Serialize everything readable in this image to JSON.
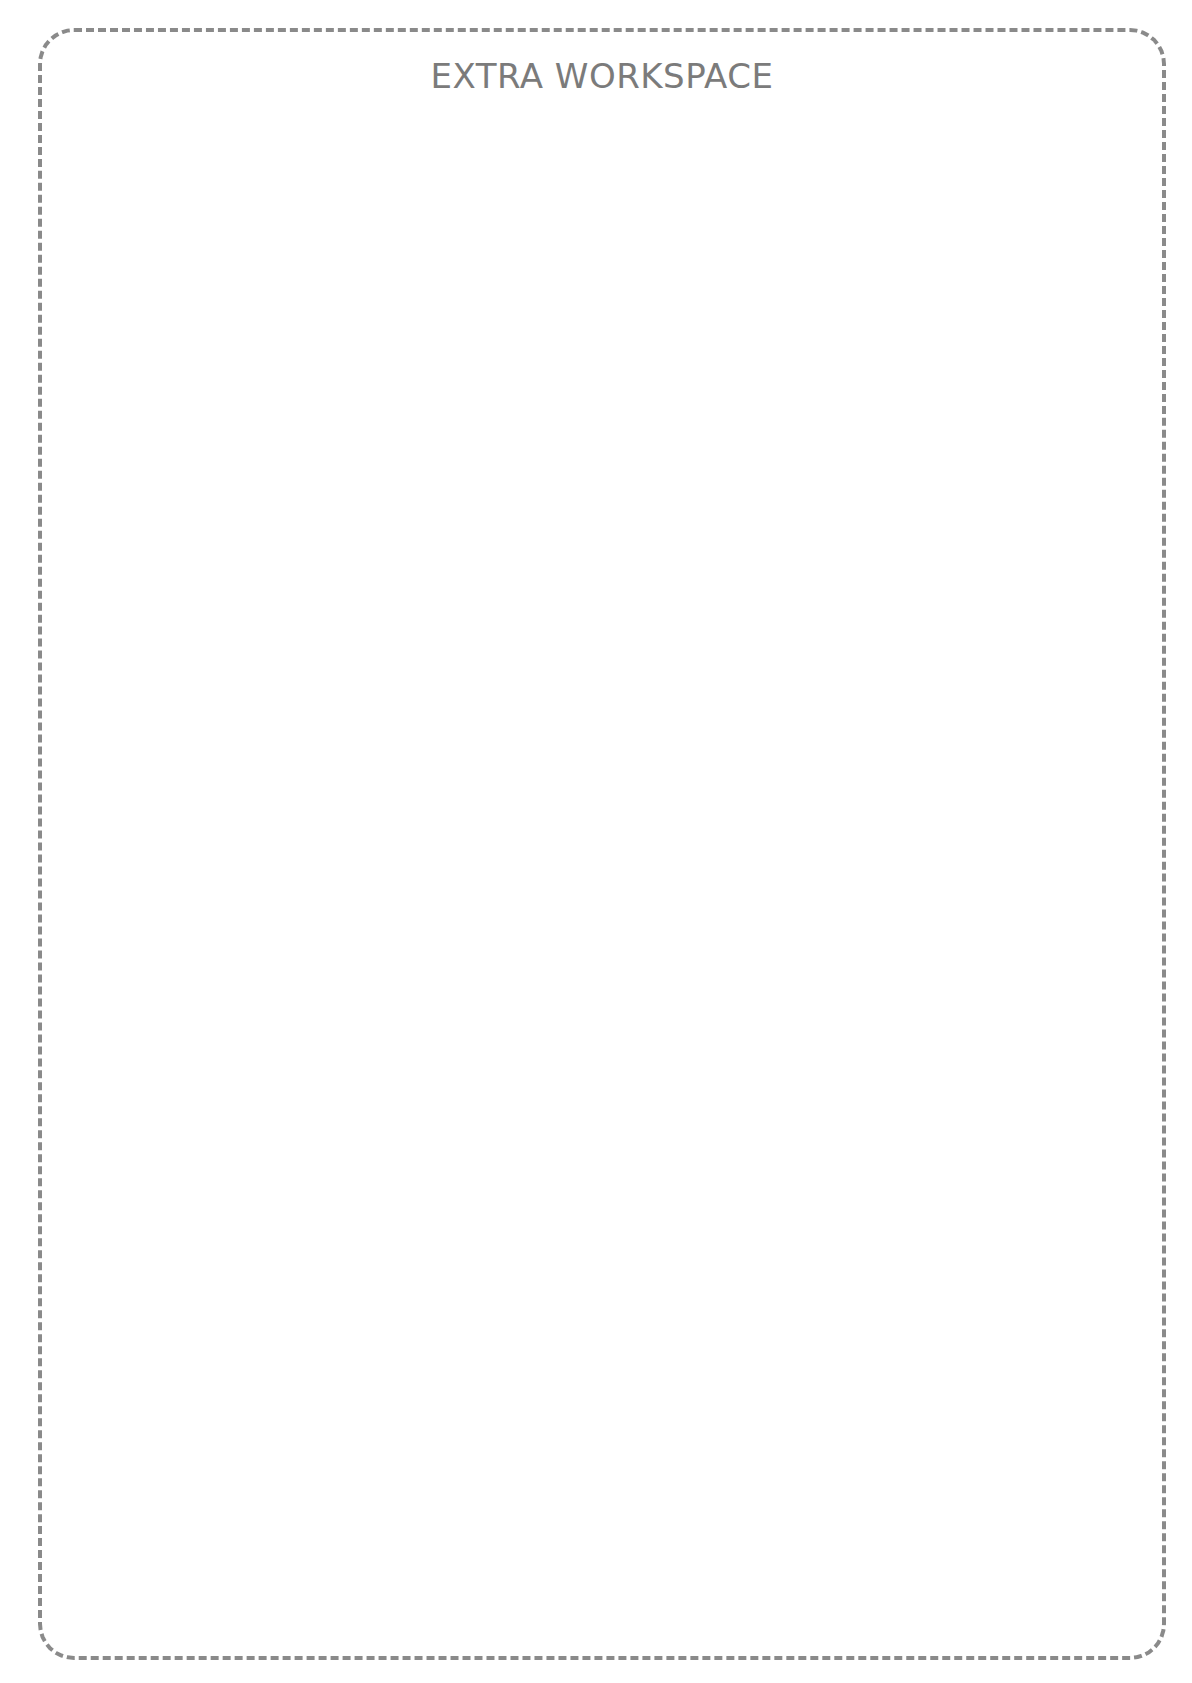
{
  "page": {
    "title": "EXTRA WORKSPACE",
    "border_color": "#8a8a8a",
    "title_color": "#7b7b7b",
    "background_color": "#ffffff"
  }
}
